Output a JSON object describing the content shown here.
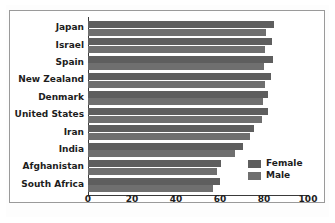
{
  "chart_data": {
    "type": "bar",
    "orientation": "horizontal",
    "title": "",
    "xlabel": "",
    "ylabel": "",
    "xlim": [
      0,
      100
    ],
    "xticks": [
      0,
      20,
      40,
      60,
      80,
      100
    ],
    "grid": false,
    "legend_position": "inside-bottom-right",
    "categories": [
      "Japan",
      "Israel",
      "Spain",
      "New Zealand",
      "Denmark",
      "United States",
      "Iran",
      "India",
      "Afghanistan",
      "South Africa"
    ],
    "series": [
      {
        "name": "Female",
        "color": "#5e5e5e",
        "values": [
          84.5,
          83.5,
          84,
          83,
          82,
          82,
          75.5,
          70.5,
          60.5,
          60
        ]
      },
      {
        "name": "Male",
        "color": "#6f6f6f",
        "values": [
          81,
          80.5,
          80,
          80.5,
          79.5,
          79,
          73.5,
          67,
          58.5,
          57
        ]
      }
    ]
  },
  "legend": {
    "items": [
      {
        "label": "Female",
        "color": "#5e5e5e"
      },
      {
        "label": "Male",
        "color": "#6f6f6f"
      }
    ]
  }
}
